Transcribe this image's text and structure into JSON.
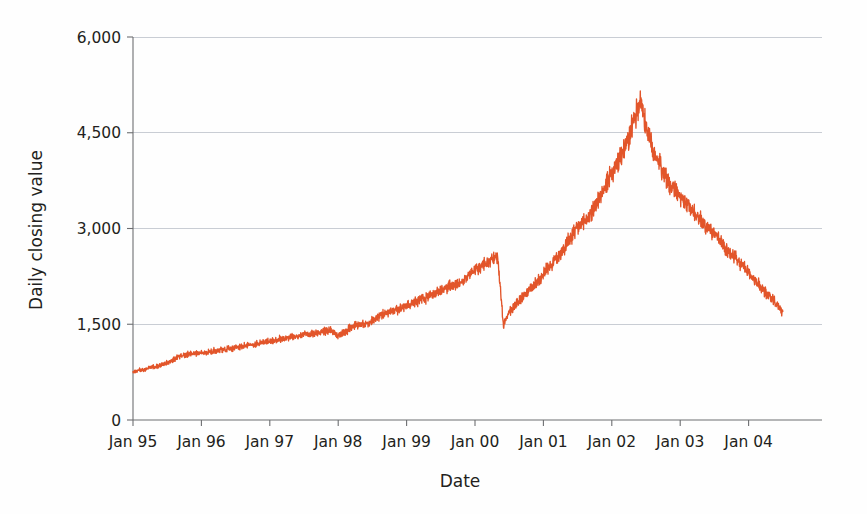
{
  "chart_data": {
    "type": "line",
    "title": "",
    "subtitle": "",
    "xlabel": "Date",
    "ylabel": "Daily closing value",
    "grid": true,
    "legend": false,
    "legend_position": "none",
    "series_color": "#e2552a",
    "xlim": [
      "Jan 95",
      "Jul 04"
    ],
    "ylim": [
      0,
      6000
    ],
    "yticks": [
      0,
      1500,
      3000,
      4500,
      6000
    ],
    "ytick_labels": [
      "0",
      "1,500",
      "3,000",
      "4,500",
      "6,000"
    ],
    "xticks": [
      "Jan 95",
      "Jan 96",
      "Jan 97",
      "Jan 98",
      "Jan 99",
      "Jan 00",
      "Jan 01",
      "Jan 02",
      "Jan 03",
      "Jan 04"
    ],
    "x_unit": "months since Jan 1995",
    "series": [
      {
        "name": "Daily closing value",
        "x": [
          0,
          1,
          2,
          3,
          4,
          5,
          6,
          7,
          8,
          9,
          10,
          11,
          12,
          13,
          14,
          15,
          16,
          17,
          18,
          19,
          20,
          21,
          22,
          23,
          24,
          25,
          26,
          27,
          28,
          29,
          30,
          31,
          32,
          33,
          34,
          35,
          36,
          37,
          38,
          39,
          40,
          41,
          42,
          43,
          44,
          45,
          46,
          47,
          48,
          49,
          50,
          51,
          52,
          53,
          54,
          55,
          56,
          57,
          58,
          59,
          60,
          61,
          62,
          63,
          64,
          65,
          66,
          67,
          68,
          69,
          70,
          71,
          72,
          73,
          74,
          75,
          76,
          77,
          78,
          79,
          80,
          81,
          82,
          83,
          84,
          85,
          86,
          87,
          88,
          89,
          90,
          91,
          92,
          93,
          94,
          95,
          96,
          97,
          98,
          99,
          100,
          101,
          102,
          103,
          104,
          105,
          106,
          107,
          108,
          109,
          110,
          111,
          112,
          113,
          114
        ],
        "values": [
          752,
          780,
          790,
          820,
          840,
          860,
          895,
          930,
          1000,
          1020,
          1040,
          1050,
          1055,
          1060,
          1080,
          1090,
          1100,
          1120,
          1130,
          1150,
          1170,
          1180,
          1200,
          1220,
          1230,
          1250,
          1270,
          1280,
          1300,
          1315,
          1330,
          1345,
          1360,
          1375,
          1390,
          1400,
          1310,
          1370,
          1430,
          1480,
          1500,
          1520,
          1560,
          1620,
          1660,
          1700,
          1720,
          1760,
          1800,
          1830,
          1860,
          1900,
          1940,
          1990,
          2030,
          2060,
          2100,
          2150,
          2190,
          2280,
          2350,
          2400,
          2470,
          2500,
          2560,
          1480,
          1700,
          1790,
          1900,
          2000,
          2080,
          2180,
          2300,
          2400,
          2500,
          2600,
          2750,
          2880,
          3000,
          3100,
          3200,
          3350,
          3500,
          3700,
          3850,
          4000,
          4200,
          4400,
          4700,
          5048,
          4600,
          4300,
          4100,
          3900,
          3700,
          3600,
          3500,
          3400,
          3300,
          3200,
          3100,
          3000,
          2900,
          2800,
          2700,
          2600,
          2500,
          2400,
          2300,
          2200,
          2100,
          2000,
          1900,
          1800,
          1700
        ],
        "values_note": "Monthly sampled daily closing values from Jan 1995 to Jul 2004"
      }
    ],
    "annotations": [],
    "peak": {
      "label": "Jan 00 peak",
      "value": 5048
    },
    "trough": {
      "label": "late 2002 trough",
      "value": 1114
    },
    "start_value": 752,
    "end_value": 2100
  }
}
